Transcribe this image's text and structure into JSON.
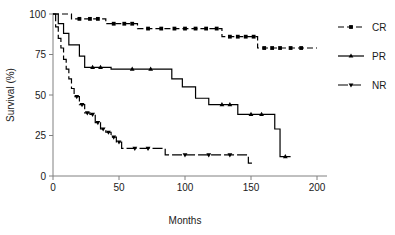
{
  "chart_data": {
    "type": "line",
    "title": "",
    "xlabel": "Months",
    "ylabel": "Survival (%)",
    "xlim": [
      0,
      200
    ],
    "ylim": [
      0,
      100
    ],
    "xticks": [
      0,
      50,
      100,
      150,
      200
    ],
    "yticks": [
      0,
      25,
      50,
      75,
      100
    ],
    "grid": false,
    "legend_position": "right",
    "series": [
      {
        "name": "CR",
        "label": "CR",
        "style": "dashed",
        "marker": "square",
        "color": "#000000",
        "steps": [
          [
            0,
            100
          ],
          [
            14,
            100
          ],
          [
            14,
            97
          ],
          [
            40,
            97
          ],
          [
            40,
            94
          ],
          [
            64,
            94
          ],
          [
            64,
            91
          ],
          [
            128,
            91
          ],
          [
            128,
            86
          ],
          [
            155,
            86
          ],
          [
            155,
            79
          ],
          [
            200,
            79
          ]
        ],
        "censor_points": [
          [
            20,
            97
          ],
          [
            28,
            97
          ],
          [
            34,
            97
          ],
          [
            46,
            94
          ],
          [
            54,
            94
          ],
          [
            60,
            94
          ],
          [
            72,
            91
          ],
          [
            82,
            91
          ],
          [
            92,
            91
          ],
          [
            100,
            91
          ],
          [
            108,
            91
          ],
          [
            116,
            91
          ],
          [
            124,
            91
          ],
          [
            134,
            86
          ],
          [
            140,
            86
          ],
          [
            146,
            86
          ],
          [
            152,
            86
          ],
          [
            160,
            79
          ],
          [
            166,
            79
          ],
          [
            172,
            79
          ],
          [
            180,
            79
          ],
          [
            188,
            79
          ]
        ]
      },
      {
        "name": "PR",
        "label": "PR",
        "style": "solid",
        "marker": "triangle",
        "color": "#000000",
        "steps": [
          [
            0,
            100
          ],
          [
            4,
            100
          ],
          [
            4,
            94
          ],
          [
            8,
            94
          ],
          [
            8,
            88
          ],
          [
            12,
            88
          ],
          [
            12,
            81
          ],
          [
            20,
            81
          ],
          [
            20,
            74
          ],
          [
            24,
            74
          ],
          [
            24,
            67
          ],
          [
            44,
            67
          ],
          [
            44,
            66
          ],
          [
            90,
            66
          ],
          [
            90,
            60
          ],
          [
            98,
            60
          ],
          [
            98,
            55
          ],
          [
            108,
            55
          ],
          [
            108,
            48
          ],
          [
            118,
            48
          ],
          [
            118,
            44
          ],
          [
            140,
            44
          ],
          [
            140,
            38
          ],
          [
            168,
            38
          ],
          [
            168,
            29
          ],
          [
            172,
            29
          ],
          [
            172,
            12
          ],
          [
            180,
            12
          ]
        ],
        "censor_points": [
          [
            30,
            67
          ],
          [
            36,
            67
          ],
          [
            60,
            66
          ],
          [
            74,
            66
          ],
          [
            128,
            44
          ],
          [
            134,
            44
          ],
          [
            150,
            38
          ],
          [
            158,
            38
          ],
          [
            176,
            12
          ]
        ]
      },
      {
        "name": "NR",
        "label": "NR",
        "style": "dashdot",
        "marker": "triangle-down",
        "color": "#000000",
        "steps": [
          [
            0,
            100
          ],
          [
            2,
            100
          ],
          [
            2,
            92
          ],
          [
            4,
            92
          ],
          [
            4,
            85
          ],
          [
            6,
            85
          ],
          [
            6,
            79
          ],
          [
            8,
            79
          ],
          [
            8,
            72
          ],
          [
            10,
            72
          ],
          [
            10,
            66
          ],
          [
            12,
            66
          ],
          [
            12,
            60
          ],
          [
            14,
            60
          ],
          [
            14,
            54
          ],
          [
            16,
            54
          ],
          [
            16,
            49
          ],
          [
            20,
            49
          ],
          [
            20,
            44
          ],
          [
            24,
            44
          ],
          [
            24,
            39
          ],
          [
            28,
            39
          ],
          [
            28,
            38
          ],
          [
            32,
            38
          ],
          [
            32,
            33
          ],
          [
            36,
            33
          ],
          [
            36,
            29
          ],
          [
            40,
            29
          ],
          [
            40,
            27
          ],
          [
            44,
            27
          ],
          [
            44,
            24
          ],
          [
            48,
            24
          ],
          [
            48,
            21
          ],
          [
            52,
            21
          ],
          [
            52,
            17
          ],
          [
            85,
            17
          ],
          [
            85,
            13
          ],
          [
            148,
            13
          ],
          [
            148,
            8
          ],
          [
            152,
            8
          ]
        ],
        "censor_points": [
          [
            18,
            49
          ],
          [
            22,
            44
          ],
          [
            26,
            39
          ],
          [
            30,
            38
          ],
          [
            34,
            33
          ],
          [
            38,
            29
          ],
          [
            42,
            27
          ],
          [
            46,
            24
          ],
          [
            50,
            21
          ],
          [
            62,
            17
          ],
          [
            72,
            17
          ],
          [
            100,
            13
          ],
          [
            118,
            13
          ],
          [
            134,
            13
          ]
        ]
      }
    ]
  },
  "axes": {
    "y_title": "Survival (%)",
    "x_title": "Months",
    "x_tick_labels": [
      "0",
      "50",
      "100",
      "150",
      "200"
    ],
    "y_tick_labels": [
      "0",
      "25",
      "50",
      "75",
      "100"
    ]
  },
  "legend": {
    "entries": [
      {
        "label": "CR",
        "style": "dashed"
      },
      {
        "label": "PR",
        "style": "solid"
      },
      {
        "label": "NR",
        "style": "dashdot"
      }
    ]
  }
}
